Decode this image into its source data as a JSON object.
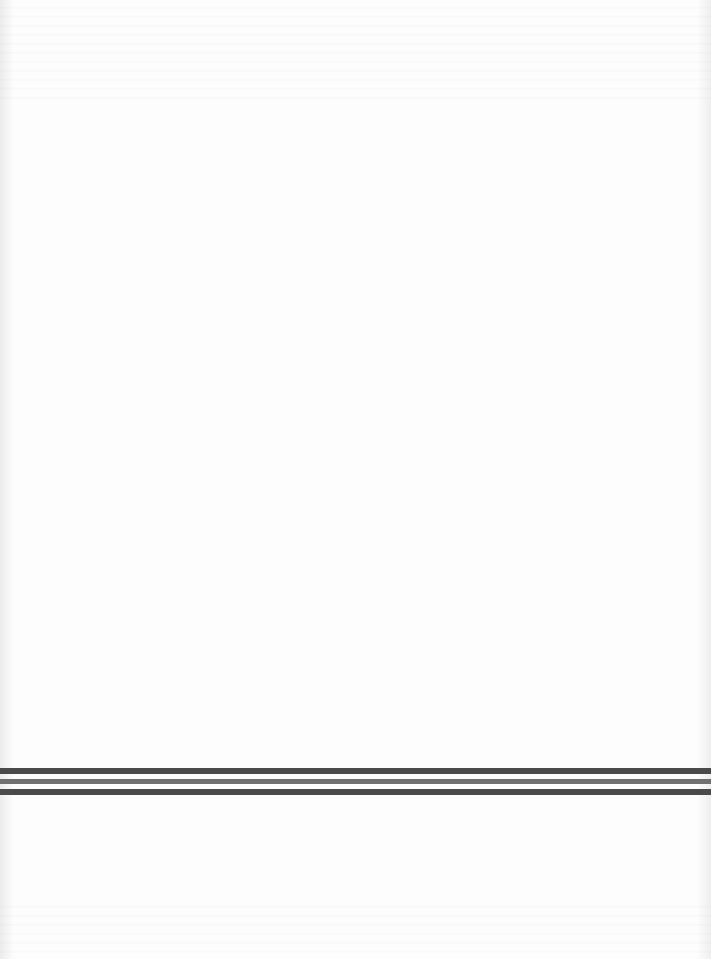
{
  "page": {
    "background": "#fdfdfd",
    "width": 711,
    "height": 959
  },
  "divider": {
    "description": "triple horizontal rule",
    "rules": [
      {
        "top": 768,
        "height": 6,
        "color": "#4a4a4a"
      },
      {
        "top": 779,
        "height": 5,
        "color": "#707070"
      },
      {
        "top": 789,
        "height": 6,
        "color": "#4a4a4a"
      }
    ]
  }
}
